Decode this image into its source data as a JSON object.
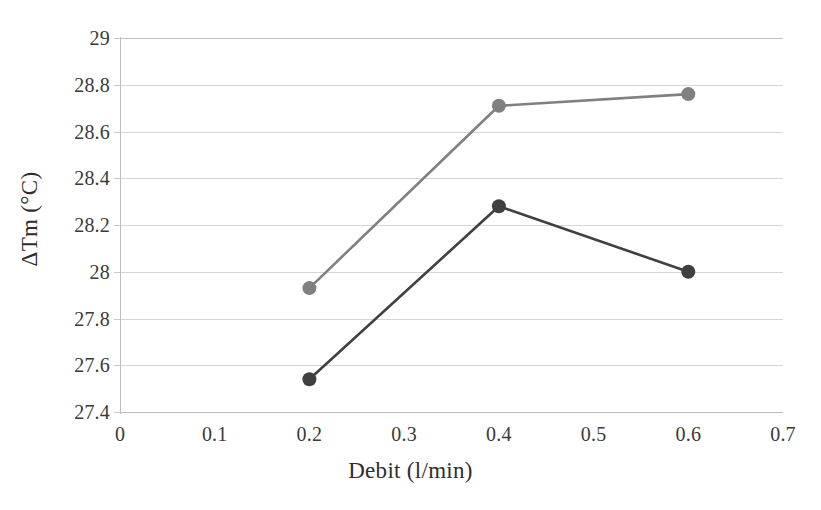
{
  "chart_data": {
    "type": "line",
    "title": "",
    "subtitle": "",
    "xlabel": "Debit (l/min)",
    "ylabel": "ΔTm (°C)",
    "x": [
      0.2,
      0.4,
      0.6
    ],
    "xlim": [
      0,
      0.7
    ],
    "ylim": [
      27.4,
      29
    ],
    "xticks": [
      "0",
      "0.1",
      "0.2",
      "0.3",
      "0.4",
      "0.5",
      "0.6",
      "0.7"
    ],
    "xtick_values": [
      0,
      0.1,
      0.2,
      0.3,
      0.4,
      0.5,
      0.6,
      0.7
    ],
    "yticks": [
      "27.4",
      "27.6",
      "27.8",
      "28",
      "28.2",
      "28.4",
      "28.6",
      "28.8",
      "29"
    ],
    "ytick_values": [
      27.4,
      27.6,
      27.8,
      28,
      28.2,
      28.4,
      28.6,
      28.8,
      29
    ],
    "grid": "horizontal",
    "legend": "none",
    "series": [
      {
        "name": "series-1",
        "color": "#808080",
        "marker": "circle",
        "values": [
          27.93,
          28.71,
          28.76
        ]
      },
      {
        "name": "series-2",
        "color": "#404040",
        "marker": "circle",
        "values": [
          27.54,
          28.28,
          28.0
        ]
      }
    ]
  },
  "colors": {
    "background": "#ffffff",
    "gridline": "#d6d6d6",
    "axis": "#bdbdbd",
    "text": "#3a3a3a",
    "series_light": "#808080",
    "series_dark": "#404040"
  }
}
